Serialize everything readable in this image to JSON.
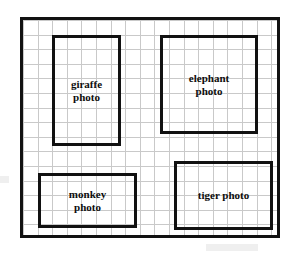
{
  "page": {
    "background_color": "#ffffff"
  },
  "board": {
    "name": "layout-board",
    "border_color": "#111111",
    "grid_color": "#c9c9c9",
    "grid_cell_px": 14.6,
    "border_width_px": 3
  },
  "photos": [
    {
      "id": "giraffe",
      "label": "giraffe\nphoto",
      "caption_line_1": "giraffe",
      "caption_line_2": "photo",
      "orientation": "portrait",
      "border_color": "#111111"
    },
    {
      "id": "elephant",
      "label": "elephant\nphoto",
      "caption_line_1": "elephant",
      "caption_line_2": "photo",
      "orientation": "square",
      "border_color": "#111111"
    },
    {
      "id": "monkey",
      "label": "monkey\nphoto",
      "caption_line_1": "monkey",
      "caption_line_2": "photo",
      "orientation": "landscape",
      "border_color": "#111111"
    },
    {
      "id": "tiger",
      "label": "tiger photo",
      "caption_line_1": "tiger photo",
      "caption_line_2": "",
      "orientation": "landscape",
      "border_color": "#111111"
    }
  ]
}
